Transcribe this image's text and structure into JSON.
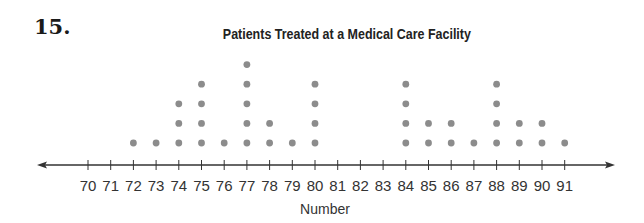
{
  "problem": {
    "number": "15."
  },
  "chart_data": {
    "type": "dot_plot",
    "title": "Patients Treated at a Medical Care Facility",
    "xlabel": "Number",
    "ylabel": "",
    "xlim": [
      70,
      91
    ],
    "ticks": [
      70,
      71,
      72,
      73,
      74,
      75,
      76,
      77,
      78,
      79,
      80,
      81,
      82,
      83,
      84,
      85,
      86,
      87,
      88,
      89,
      90,
      91
    ],
    "tick_labels": [
      "70",
      "71",
      "72",
      "73",
      "74",
      "75",
      "76",
      "77",
      "78",
      "79",
      "80",
      "81",
      "82",
      "83",
      "84",
      "85",
      "86",
      "87",
      "88",
      "89",
      "90",
      "91"
    ],
    "categories": [
      72,
      73,
      74,
      75,
      76,
      77,
      78,
      79,
      80,
      84,
      85,
      86,
      87,
      88,
      89,
      90,
      91
    ],
    "values": [
      1,
      1,
      3,
      4,
      1,
      5,
      2,
      1,
      4,
      4,
      2,
      2,
      1,
      4,
      2,
      2,
      1
    ],
    "total_count": 40,
    "dot_color": "#8c8c8c",
    "axis_color": "#333333",
    "grid": false,
    "legend": null
  }
}
